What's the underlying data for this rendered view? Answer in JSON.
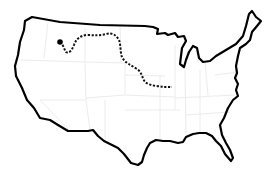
{
  "map": {
    "subject": "Continental United States outline",
    "colors": {
      "background": "#ffffff",
      "outline": "#000000",
      "state_lines": "#eeeeee",
      "route": "#111111"
    },
    "route": {
      "style": "dashed",
      "start_marker": "filled-dot",
      "start_point": [
        60,
        42
      ],
      "end_point": [
        172,
        87
      ]
    }
  }
}
